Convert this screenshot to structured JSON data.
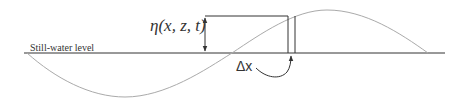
{
  "diagram": {
    "still_water_label": "Still-water level",
    "elevation_label": "η(x, z, t)",
    "delta_label": "Δx",
    "colors": {
      "wave": "#aaaaaa",
      "lines": "#333333"
    }
  }
}
